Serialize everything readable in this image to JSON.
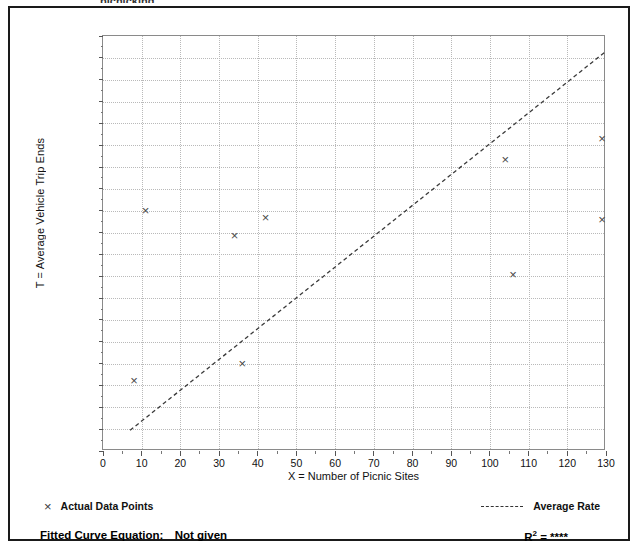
{
  "figure": {
    "cut_title": "picnicking",
    "legend": {
      "data_points_label": "Actual Data Points",
      "data_points_glyph": "×",
      "average_rate_label": "Average Rate"
    },
    "footer": {
      "fitted_curve_label": "Fitted Curve Equation:",
      "fitted_curve_value": "Not given",
      "r_squared_label": "R",
      "r_squared_exponent": "2",
      "r_squared_equals": "=",
      "r_squared_value": "****"
    }
  },
  "chart_data": {
    "type": "scatter",
    "title": "",
    "xlabel": "X = Number of Picnic Sites",
    "ylabel": "T = Average Vehicle Trip Ends",
    "xlim": [
      0,
      130
    ],
    "ylim": [
      0,
      1900
    ],
    "xticks": [
      0,
      10,
      20,
      30,
      40,
      50,
      60,
      70,
      80,
      90,
      100,
      110,
      120,
      130
    ],
    "xtick_labels": [
      "0",
      "10",
      "20",
      "30",
      "40",
      "50",
      "60",
      "70",
      "80",
      "90",
      "100",
      "110",
      "120",
      "130"
    ],
    "yticks": [
      0,
      100,
      200,
      300,
      400,
      500,
      600,
      700,
      800,
      900,
      1000,
      1100,
      1200,
      1300,
      1400,
      1500,
      1600,
      1700,
      1800,
      1900
    ],
    "ytick_labels": [
      "0",
      "100",
      "200",
      "300",
      "400",
      "500",
      "600",
      "700",
      "800",
      "900",
      "1,000",
      "1,100",
      "1,200",
      "1,300",
      "1,400",
      "1,500",
      "1,600",
      "1,700",
      "1,800",
      "1,900"
    ],
    "grid": true,
    "grid_style": "dotted",
    "legend_position": "below-axes",
    "series": [
      {
        "name": "Actual Data Points",
        "type": "scatter",
        "marker": "x",
        "color": "#4a4a4a",
        "points": [
          {
            "x": 8,
            "y": 325
          },
          {
            "x": 11,
            "y": 1100
          },
          {
            "x": 34,
            "y": 985
          },
          {
            "x": 36,
            "y": 400
          },
          {
            "x": 42,
            "y": 1070
          },
          {
            "x": 104,
            "y": 1335
          },
          {
            "x": 106,
            "y": 810
          },
          {
            "x": 129,
            "y": 1430
          },
          {
            "x": 129,
            "y": 1060
          }
        ]
      },
      {
        "name": "Average Rate",
        "type": "line",
        "style": "dashed",
        "color": "#3a3a3a",
        "endpoints": [
          {
            "x": 7,
            "y": 95
          },
          {
            "x": 130,
            "y": 1830
          }
        ],
        "slope": 14.1,
        "intercept": 0
      }
    ]
  }
}
